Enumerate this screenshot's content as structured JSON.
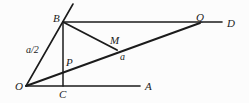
{
  "figure": {
    "type": "geometry-diagram",
    "title": "",
    "canvas": {
      "width": 249,
      "height": 103
    },
    "background_color": "#fcfcfc",
    "stroke_color": "#1b1b1b",
    "points": {
      "O": {
        "x": 26,
        "y": 86,
        "label": "O",
        "label_x": 17,
        "label_y": 88
      },
      "B": {
        "x": 63,
        "y": 22,
        "label": "B",
        "label_x": 53,
        "label_y": 14
      },
      "C": {
        "x": 63,
        "y": 86,
        "label": "C",
        "label_x": 60,
        "label_y": 96
      },
      "A": {
        "x": 140,
        "y": 86,
        "label": "A",
        "label_x": 145,
        "label_y": 88
      },
      "D": {
        "x": 222,
        "y": 22,
        "label": "D",
        "label_x": 227,
        "label_y": 24
      },
      "Q": {
        "x": 200,
        "y": 23,
        "label": "Q",
        "label_x": 196,
        "label_y": 14
      },
      "M": {
        "x": 117,
        "y": 50,
        "label": "M",
        "label_x": 111,
        "label_y": 41
      },
      "P": {
        "x": 63,
        "y": 73,
        "label": "P",
        "label_x": 66,
        "label_y": 64
      },
      "RayTip": {
        "x": 73,
        "y": 4,
        "label": "",
        "label_x": 0,
        "label_y": 0
      }
    },
    "segments": [
      {
        "name": "segment-OA",
        "from": "O",
        "to": "A"
      },
      {
        "name": "segment-OQ",
        "from": "O",
        "to": "Q"
      },
      {
        "name": "segment-BD",
        "from": "B",
        "to": "D"
      },
      {
        "name": "segment-BC",
        "from": "B",
        "to": "C"
      },
      {
        "name": "segment-BM",
        "from": "B",
        "to": "M"
      },
      {
        "name": "ray-OB-extended",
        "from": "O",
        "to": "RayTip"
      }
    ],
    "measure_labels": [
      {
        "name": "label-a-over-2",
        "text": "a/2",
        "x": 26,
        "y": 45
      },
      {
        "name": "label-a",
        "text": "a",
        "x": 120,
        "y": 52
      }
    ],
    "point_labels": [
      {
        "name": "point-label-B",
        "text": "B",
        "x": 53,
        "y": 13
      },
      {
        "name": "point-label-Q",
        "text": "Q",
        "x": 196,
        "y": 12
      },
      {
        "name": "point-label-D",
        "text": "D",
        "x": 227,
        "y": 18
      },
      {
        "name": "point-label-M",
        "text": "M",
        "x": 110,
        "y": 35
      },
      {
        "name": "point-label-P",
        "text": "P",
        "x": 66,
        "y": 57
      },
      {
        "name": "point-label-O",
        "text": "O",
        "x": 15,
        "y": 81
      },
      {
        "name": "point-label-C",
        "text": "C",
        "x": 59,
        "y": 89
      },
      {
        "name": "point-label-A",
        "text": "A",
        "x": 145,
        "y": 81
      }
    ]
  }
}
